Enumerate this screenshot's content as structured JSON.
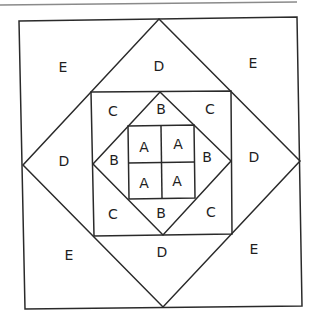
{
  "diagram": {
    "kind": "quilt-block-pattern",
    "canvas": {
      "width": 317,
      "height": 324
    },
    "colors": {
      "line": "#2a2a2a",
      "rule": "#8a8a8a",
      "text": "#1e1e1e",
      "background": "#ffffff"
    },
    "top_rule": {
      "x1": 0,
      "y1": 5,
      "x2": 297,
      "y2": 2
    },
    "shapes": [
      {
        "id": "outer-square",
        "points": [
          [
            19,
            21
          ],
          [
            297,
            17
          ],
          [
            302,
            306
          ],
          [
            25,
            309
          ]
        ]
      },
      {
        "id": "outer-diamond",
        "points": [
          [
            159,
            19
          ],
          [
            300,
            161
          ],
          [
            163,
            307
          ],
          [
            23,
            165
          ]
        ]
      },
      {
        "id": "middle-square",
        "points": [
          [
            91,
            92
          ],
          [
            231,
            91
          ],
          [
            232,
            234
          ],
          [
            94,
            236
          ]
        ]
      },
      {
        "id": "inner-diamond",
        "points": [
          [
            160,
            92
          ],
          [
            231,
            161
          ],
          [
            163,
            235
          ],
          [
            93,
            164
          ]
        ]
      },
      {
        "id": "center-square",
        "points": [
          [
            128,
            126
          ],
          [
            194,
            125
          ],
          [
            195,
            198
          ],
          [
            129,
            199
          ]
        ]
      }
    ],
    "lines": [
      {
        "id": "center-vertical",
        "x1": 161,
        "y1": 126,
        "x2": 162,
        "y2": 198
      },
      {
        "id": "center-horizontal",
        "x1": 128,
        "y1": 163,
        "x2": 195,
        "y2": 162
      }
    ],
    "labels": [
      {
        "id": "e-top-left",
        "text": "E",
        "x": 63,
        "y": 67
      },
      {
        "id": "d-top",
        "text": "D",
        "x": 159,
        "y": 66
      },
      {
        "id": "e-top-right",
        "text": "E",
        "x": 253,
        "y": 63
      },
      {
        "id": "d-left",
        "text": "D",
        "x": 64,
        "y": 161
      },
      {
        "id": "d-right",
        "text": "D",
        "x": 254,
        "y": 157
      },
      {
        "id": "e-bottom-left",
        "text": "E",
        "x": 69,
        "y": 255
      },
      {
        "id": "d-bottom",
        "text": "D",
        "x": 162,
        "y": 252
      },
      {
        "id": "e-bottom-right",
        "text": "E",
        "x": 254,
        "y": 249
      },
      {
        "id": "c-top-left",
        "text": "C",
        "x": 113,
        "y": 111
      },
      {
        "id": "c-top-right",
        "text": "C",
        "x": 210,
        "y": 109
      },
      {
        "id": "c-bottom-left",
        "text": "C",
        "x": 113,
        "y": 214
      },
      {
        "id": "c-bottom-right",
        "text": "C",
        "x": 211,
        "y": 212
      },
      {
        "id": "b-top",
        "text": "B",
        "x": 161,
        "y": 109
      },
      {
        "id": "b-left",
        "text": "B",
        "x": 114,
        "y": 160
      },
      {
        "id": "b-right",
        "text": "B",
        "x": 207,
        "y": 157
      },
      {
        "id": "b-bottom",
        "text": "B",
        "x": 161,
        "y": 213
      },
      {
        "id": "a-top-left",
        "text": "A",
        "x": 144,
        "y": 147
      },
      {
        "id": "a-top-right",
        "text": "A",
        "x": 178,
        "y": 144
      },
      {
        "id": "a-bottom-left",
        "text": "A",
        "x": 144,
        "y": 183
      },
      {
        "id": "a-bottom-right",
        "text": "A",
        "x": 177,
        "y": 181
      }
    ]
  }
}
